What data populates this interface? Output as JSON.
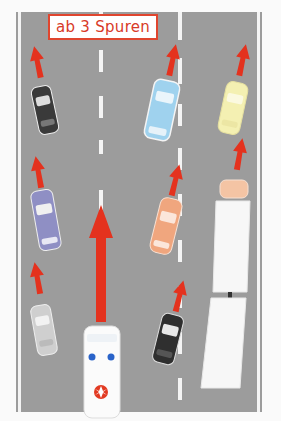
{
  "sign": {
    "label": "ab 3 Spuren"
  },
  "colors": {
    "road": "#9c9c9c",
    "lane_marking": "#f4f4f4",
    "arrow": "#e4321e",
    "sign_border": "#e0452e"
  },
  "vehicles": [
    {
      "id": "car-black-left",
      "type": "car",
      "color": "#3a3a3a"
    },
    {
      "id": "car-purple-left",
      "type": "car",
      "color": "#8f8fc4"
    },
    {
      "id": "car-silver-left",
      "type": "car",
      "color": "#cfcfcf"
    },
    {
      "id": "ambulance",
      "type": "ambulance",
      "color": "#ffffff"
    },
    {
      "id": "car-blue-middle",
      "type": "car",
      "color": "#9fd2ee"
    },
    {
      "id": "car-orange-middle",
      "type": "car",
      "color": "#f0a67e"
    },
    {
      "id": "car-black-middle",
      "type": "car",
      "color": "#2f2f2f"
    },
    {
      "id": "car-yellow-right",
      "type": "car",
      "color": "#f4f0b2"
    },
    {
      "id": "truck-right",
      "type": "truck",
      "color": "#f6f6f6"
    }
  ]
}
